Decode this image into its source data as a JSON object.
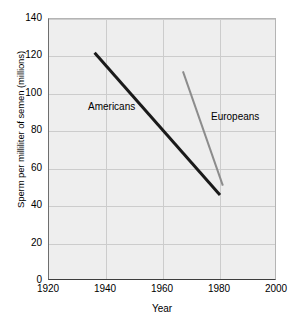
{
  "chart_data": {
    "type": "line",
    "title": "",
    "xlabel": "Year",
    "ylabel": "Sperm per milliliter of semen (millions)",
    "xlim": [
      1920,
      2000
    ],
    "ylim": [
      0,
      140
    ],
    "xticks": [
      1920,
      1940,
      1960,
      1980,
      2000
    ],
    "yticks": [
      0,
      20,
      40,
      60,
      80,
      100,
      120,
      140
    ],
    "grid": true,
    "legend": "inline-annotations",
    "series": [
      {
        "name": "Americans",
        "color": "#1a1a1a",
        "linewidth": 3,
        "x": [
          1936,
          1980
        ],
        "values": [
          122,
          46
        ],
        "annotation": "Americans"
      },
      {
        "name": "Europeans",
        "color": "#8c8c8c",
        "linewidth": 2,
        "x": [
          1967,
          1981
        ],
        "values": [
          112,
          51
        ],
        "annotation": "Europeans"
      }
    ]
  },
  "axes": {
    "y_title": "Sperm per milliliter of semen (millions)",
    "x_title": "Year",
    "y_tick_labels": [
      "0",
      "20",
      "40",
      "60",
      "80",
      "100",
      "120",
      "140"
    ],
    "x_tick_labels": [
      "1920",
      "1940",
      "1960",
      "1980",
      "2000"
    ]
  },
  "annotations": {
    "americans": "Americans",
    "europeans": "Europeans"
  },
  "colors": {
    "plot_background": "#eeeeee",
    "gridline": "#cccccc",
    "americans_line": "#1a1a1a",
    "europeans_line": "#8c8c8c",
    "text": "#000000"
  }
}
